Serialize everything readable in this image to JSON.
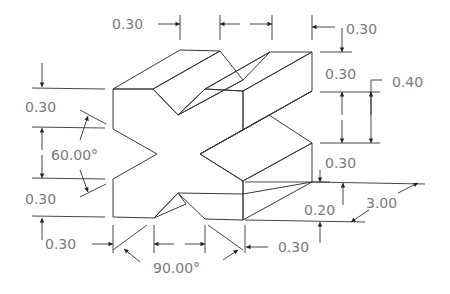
{
  "figure": {
    "type": "isometric-dimensioned-drawing"
  },
  "colors": {
    "front_face": "#efefef",
    "top_face": "#d4d4d4",
    "side_face": "#e2e2e2",
    "groove_face": "#c8c8c8",
    "edge": "#3a3a3a",
    "dimension_text": "#7a7a7a"
  },
  "dimensions": {
    "top_left_width": "0.30",
    "top_groove_width": "",
    "top_right_width": "0.30",
    "right_top_height": "0.30",
    "right_groove_height": "0.30",
    "right_overall_groove": "0.40",
    "right_lower_height": "0.30",
    "right_bottom_height": "0.20",
    "depth": "3.00",
    "left_top_height": "0.30",
    "left_angle": "60.00°",
    "left_bottom_height": "0.30",
    "bottom_left_width": "0.30",
    "bottom_angle": "90.00°",
    "bottom_right_width": "0.30"
  }
}
